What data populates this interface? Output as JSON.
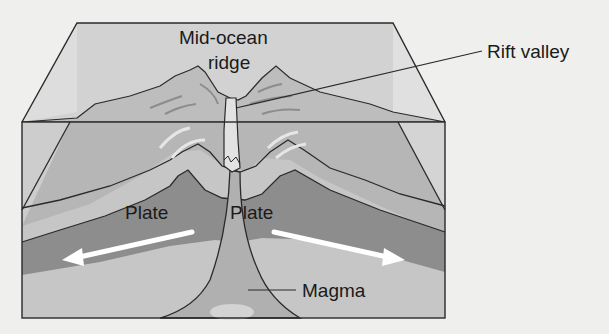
{
  "diagram": {
    "type": "block-diagram",
    "labels": {
      "mid_ocean_ridge_line1": "Mid-ocean",
      "mid_ocean_ridge_line2": "ridge",
      "rift_valley": "Rift valley",
      "plate_left": "Plate",
      "plate_right": "Plate",
      "magma": "Magma"
    },
    "arrows": [
      {
        "name": "left-plate-motion",
        "direction": "left"
      },
      {
        "name": "right-plate-motion",
        "direction": "right"
      }
    ],
    "colors": {
      "background": "#efefed",
      "ocean_back": "#cfcfcf",
      "ocean_side": "#dcdcdc",
      "crust_light": "#c2c2c2",
      "crust_mid": "#a9a9a9",
      "plate_dark": "#8e8e8e",
      "mantle": "#bdbdbd",
      "magma": "#b4b4b4",
      "rift": "#dedede",
      "outline": "#2a2a2a",
      "arrow": "#ffffff"
    }
  }
}
